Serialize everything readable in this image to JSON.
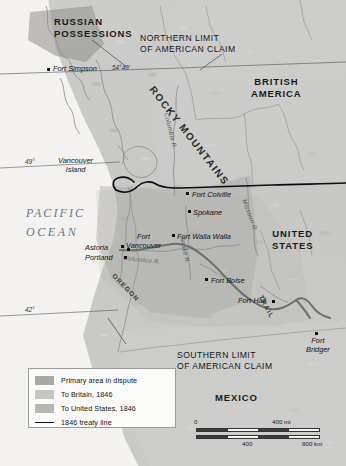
{
  "map": {
    "title": "Oregon Country boundary dispute, 1846",
    "width": 346,
    "height": 466,
    "regions": [
      {
        "id": "russian-possessions",
        "label": "RUSSIAN\nPOSSESSIONS",
        "line1": "RUSSIAN",
        "line2": "POSSESSIONS"
      },
      {
        "id": "british-america",
        "label": "BRITISH\nAMERICA",
        "line1": "BRITISH",
        "line2": "AMERICA"
      },
      {
        "id": "united-states",
        "label": "UNITED\nSTATES",
        "line1": "UNITED",
        "line2": "STATES"
      },
      {
        "id": "mexico",
        "label": "MEXICO",
        "line1": "MEXICO",
        "line2": ""
      }
    ],
    "claim_limits": [
      {
        "id": "northern-limit",
        "line1": "NORTHERN LIMIT",
        "line2": "OF AMERICAN CLAIM"
      },
      {
        "id": "southern-limit",
        "line1": "SOUTHERN LIMIT",
        "line2": "OF AMERICAN CLAIM"
      }
    ],
    "ocean": {
      "line1": "PACIFIC",
      "line2": "OCEAN"
    },
    "mountains": "ROCKY MOUNTAINS",
    "trail": "OREGON TRAIL",
    "trail_word_1": "OREGON",
    "trail_word_2": "TRAIL",
    "latitudes": [
      {
        "id": "lat-54-40",
        "label": "54°40'"
      },
      {
        "id": "lat-49",
        "label": "49°"
      },
      {
        "id": "lat-42",
        "label": "42°"
      }
    ],
    "places": [
      {
        "id": "fort-simpson",
        "label": "Fort Simpson"
      },
      {
        "id": "vancouver-island",
        "label": "Vancouver\nIsland",
        "line1": "Vancouver",
        "line2": "Island"
      },
      {
        "id": "fort-colville",
        "label": "Fort Colville"
      },
      {
        "id": "spokane",
        "label": "Spokane"
      },
      {
        "id": "fort-walla-walla",
        "label": "Fort Walla Walla"
      },
      {
        "id": "astoria",
        "label": "Astoria"
      },
      {
        "id": "fort-vancouver",
        "label": "Fort\nVancouver",
        "line1": "Fort",
        "line2": "Vancouver"
      },
      {
        "id": "portland",
        "label": "Portland"
      },
      {
        "id": "fort-boise",
        "label": "Fort Boise"
      },
      {
        "id": "fort-hall",
        "label": "Fort Hall"
      },
      {
        "id": "fort-bridger",
        "label": "Fort\nBridger",
        "line1": "Fort",
        "line2": "Bridger"
      }
    ],
    "rivers": [
      {
        "id": "columbia-river-north",
        "label": "Columbia R."
      },
      {
        "id": "columbia-river-lower",
        "label": "Columbia R."
      },
      {
        "id": "missouri-river",
        "label": "Missouri R."
      },
      {
        "id": "snake-river",
        "label": "Snake R."
      }
    ]
  },
  "legend": {
    "items": [
      {
        "id": "primary-dispute",
        "label": "Primary area in dispute",
        "color": "#a9a9a6",
        "type": "swatch"
      },
      {
        "id": "to-britain",
        "label": "To Britain, 1846",
        "color": "#c6c6c3",
        "type": "swatch"
      },
      {
        "id": "to-united-states",
        "label": "To United States, 1846",
        "color": "#b6b6b3",
        "type": "swatch"
      },
      {
        "id": "treaty-line",
        "label": "1846 treaty line",
        "color": "#111111",
        "type": "line"
      }
    ]
  },
  "scale": {
    "miles": {
      "start": "0",
      "end": "400 mi"
    },
    "km": {
      "mid": "400",
      "end": "800 km"
    }
  }
}
